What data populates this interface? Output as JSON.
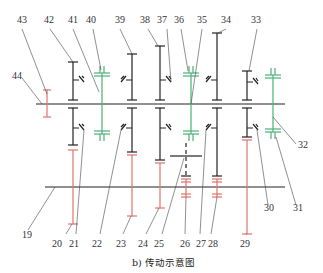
{
  "diagram": {
    "caption": "b) 传动示意图",
    "colors": {
      "shaft": "#222222",
      "gear_red": "#e0736a",
      "gear_green": "#4caf7a",
      "leader": "#444444"
    },
    "labels_top": [
      "43",
      "42",
      "41",
      "40",
      "39",
      "38",
      "37",
      "36",
      "35",
      "34",
      "33"
    ],
    "labels_left": [
      "44",
      "19"
    ],
    "labels_right": [
      "32"
    ],
    "labels_bottom": [
      "20",
      "21",
      "22",
      "23",
      "24",
      "25",
      "26",
      "27",
      "28",
      "29",
      "30",
      "31"
    ]
  }
}
